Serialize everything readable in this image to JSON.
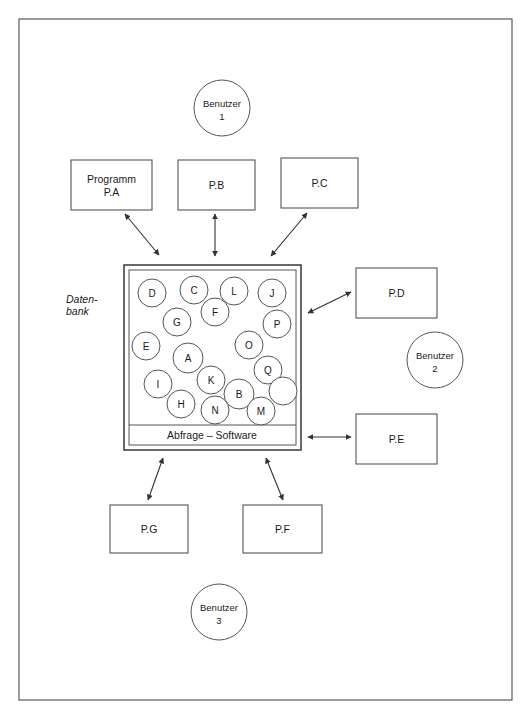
{
  "diagram": {
    "frame": {
      "x": 19,
      "y": 19,
      "width": 493,
      "height": 681
    },
    "colors": {
      "background": "#ffffff",
      "stroke": "#555555",
      "frame_stroke": "#4a4a4a",
      "text": "#1a1a1a",
      "connector": "#333333"
    },
    "database": {
      "side_label_line1": "Daten-",
      "side_label_line2": "bank",
      "side_label_x": 66,
      "side_label_y1": 303,
      "side_label_y2": 315,
      "outer": {
        "x": 124,
        "y": 265,
        "width": 177,
        "height": 185
      },
      "inner": {
        "x": 129,
        "y": 270,
        "width": 167,
        "height": 175
      },
      "divider_y": 425,
      "bar_label": "Abfrage – Software",
      "bar_label_x": 212,
      "bar_label_y": 439,
      "nodes": [
        {
          "label": "D",
          "cx": 152,
          "cy": 293,
          "r": 14
        },
        {
          "label": "C",
          "cx": 194,
          "cy": 290,
          "r": 14
        },
        {
          "label": "L",
          "cx": 234,
          "cy": 291,
          "r": 14
        },
        {
          "label": "J",
          "cx": 272,
          "cy": 293,
          "r": 14
        },
        {
          "label": "G",
          "cx": 177,
          "cy": 322,
          "r": 14
        },
        {
          "label": "F",
          "cx": 215,
          "cy": 312,
          "r": 14
        },
        {
          "label": "P",
          "cx": 277,
          "cy": 324,
          "r": 14
        },
        {
          "label": "E",
          "cx": 146,
          "cy": 346,
          "r": 14
        },
        {
          "label": "O",
          "cx": 249,
          "cy": 345,
          "r": 14
        },
        {
          "label": "A",
          "cx": 188,
          "cy": 358,
          "r": 15
        },
        {
          "label": "Q",
          "cx": 268,
          "cy": 370,
          "r": 14
        },
        {
          "label": "I",
          "cx": 158,
          "cy": 384,
          "r": 14
        },
        {
          "label": "K",
          "cx": 211,
          "cy": 380,
          "r": 14
        },
        {
          "label": "B",
          "cx": 239,
          "cy": 394,
          "r": 15
        },
        {
          "label": "",
          "cx": 283,
          "cy": 391,
          "r": 14
        },
        {
          "label": "H",
          "cx": 181,
          "cy": 404,
          "r": 14
        },
        {
          "label": "N",
          "cx": 215,
          "cy": 410,
          "r": 14
        },
        {
          "label": "M",
          "cx": 261,
          "cy": 411,
          "r": 14
        }
      ]
    },
    "programs": [
      {
        "id": "pa",
        "line1": "Programm",
        "line2": "P.A",
        "x": 71,
        "y": 160,
        "width": 81,
        "height": 50
      },
      {
        "id": "pb",
        "line1": "P.B",
        "line2": "",
        "x": 178,
        "y": 160,
        "width": 77,
        "height": 50
      },
      {
        "id": "pc",
        "line1": "P.C",
        "line2": "",
        "x": 281,
        "y": 158,
        "width": 77,
        "height": 50
      },
      {
        "id": "pd",
        "line1": "P.D",
        "line2": "",
        "x": 356,
        "y": 268,
        "width": 81,
        "height": 50
      },
      {
        "id": "pe",
        "line1": "P.E",
        "line2": "",
        "x": 356,
        "y": 414,
        "width": 81,
        "height": 50
      },
      {
        "id": "pg",
        "line1": "P.G",
        "line2": "",
        "x": 110,
        "y": 505,
        "width": 78,
        "height": 48
      },
      {
        "id": "pf",
        "line1": "P.F",
        "line2": "",
        "x": 243,
        "y": 505,
        "width": 79,
        "height": 48
      }
    ],
    "users": [
      {
        "id": "benutzer-1",
        "line1": "Benutzer",
        "line2": "1",
        "cx": 222,
        "cy": 108,
        "r": 28
      },
      {
        "id": "benutzer-2",
        "line1": "Benutzer",
        "line2": "2",
        "cx": 435,
        "cy": 360,
        "r": 28
      },
      {
        "id": "benutzer-3",
        "line1": "Benutzer",
        "line2": "3",
        "cx": 219,
        "cy": 612,
        "r": 28
      }
    ],
    "connectors": [
      {
        "id": "db-to-pa",
        "x1": 159,
        "y1": 255,
        "x2": 125,
        "y2": 214
      },
      {
        "id": "db-to-pb",
        "x1": 215,
        "y1": 256,
        "x2": 215,
        "y2": 214
      },
      {
        "id": "db-to-pc",
        "x1": 271,
        "y1": 256,
        "x2": 307,
        "y2": 213
      },
      {
        "id": "db-to-pd",
        "x1": 308,
        "y1": 313,
        "x2": 351,
        "y2": 292
      },
      {
        "id": "db-to-pe",
        "x1": 308,
        "y1": 437,
        "x2": 351,
        "y2": 437
      },
      {
        "id": "db-to-pg",
        "x1": 163,
        "y1": 458,
        "x2": 148,
        "y2": 500
      },
      {
        "id": "db-to-pf",
        "x1": 266,
        "y1": 458,
        "x2": 283,
        "y2": 500
      }
    ]
  }
}
